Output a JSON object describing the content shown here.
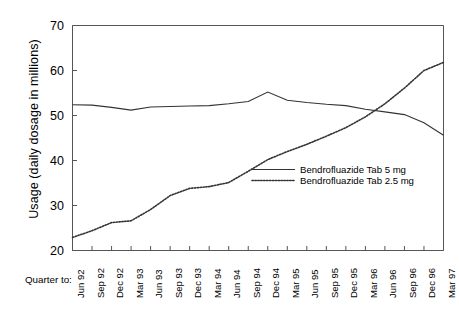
{
  "chart_data": {
    "type": "line",
    "title": "",
    "xlabel": "Quarter to:",
    "ylabel": "Usage (daily dosage in millions)",
    "ylim": [
      20,
      70
    ],
    "yticks": [
      20,
      30,
      40,
      50,
      60,
      70
    ],
    "grid": false,
    "legend_position": "center-right-inside",
    "categories": [
      "Jun 92",
      "Sep 92",
      "Dec 92",
      "Mar 93",
      "Jun 93",
      "Sep 93",
      "Dec 93",
      "Mar 94",
      "Jun 94",
      "Sep 94",
      "Dec 94",
      "Mar 95",
      "Jun 95",
      "Sep 95",
      "Dec 95",
      "Mar 96",
      "Jun 96",
      "Sep 96",
      "Dec 96",
      "Mar 97"
    ],
    "series": [
      {
        "name": "Bendrofluazide Tab 5 mg",
        "style": "solid",
        "color": "#333333",
        "values": [
          52.4,
          52.3,
          51.8,
          51.2,
          51.9,
          52.0,
          52.1,
          52.2,
          52.6,
          53.1,
          55.2,
          53.4,
          52.9,
          52.5,
          52.2,
          51.4,
          50.8,
          50.2,
          48.4,
          45.6
        ]
      },
      {
        "name": "Bendrofluazide Tab 2.5 mg",
        "style": "dotted",
        "color": "#333333",
        "values": [
          22.9,
          24.4,
          26.2,
          26.6,
          29.1,
          32.2,
          33.8,
          34.2,
          35.1,
          37.6,
          40.2,
          42.0,
          43.6,
          45.4,
          47.3,
          49.7,
          52.6,
          56.1,
          60.0,
          61.8
        ]
      }
    ]
  },
  "axes": {
    "y_title": "Usage (daily dosage in millions)",
    "y_ticks": [
      "70",
      "60",
      "50",
      "40",
      "30",
      "20"
    ],
    "x_prefix_label": "Quarter to:",
    "x_ticks": [
      "Jun 92",
      "Sep 92",
      "Dec 92",
      "Mar 93",
      "Jun 93",
      "Sep 93",
      "Dec 93",
      "Mar 94",
      "Jun 94",
      "Sep 94",
      "Dec 94",
      "Mar 95",
      "Jun 95",
      "Sep 95",
      "Dec 95",
      "Mar 96",
      "Jun 96",
      "Sep 96",
      "Dec 96",
      "Mar 97"
    ]
  },
  "legend": {
    "items": [
      {
        "label": "Bendrofluazide Tab 5 mg",
        "style": "solid"
      },
      {
        "label": "Bendrofluazide Tab 2.5 mg",
        "style": "dotted"
      }
    ]
  },
  "colors": {
    "line": "#333333",
    "frame": "#555555",
    "background": "#ffffff"
  }
}
